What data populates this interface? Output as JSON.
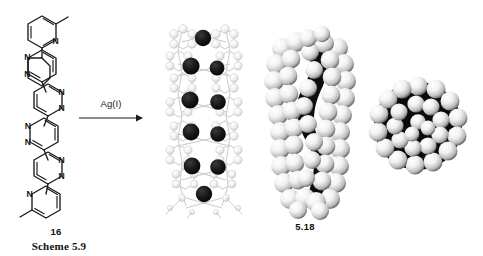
{
  "scheme": {
    "caption": "Scheme 5.9",
    "reagent": "Ag(I)",
    "reactant_label": "16",
    "product_label": "5.18"
  },
  "reactant": {
    "name": "16",
    "description": "Oligopyridazine strand: bis(6-methylpyridin-2-yl) end-capped quaterpyridazine",
    "atom_labels": [
      "N",
      "N",
      "N",
      "N",
      "N",
      "N",
      "N",
      "N",
      "N",
      "N"
    ],
    "rings": [
      {
        "index": 0,
        "type": "pyridine",
        "nitrogen_side": "right",
        "substituent": "methyl"
      },
      {
        "index": 1,
        "type": "pyridazine",
        "nitrogen_side": "left"
      },
      {
        "index": 2,
        "type": "pyridazine",
        "nitrogen_side": "right"
      },
      {
        "index": 3,
        "type": "pyridazine",
        "nitrogen_side": "left"
      },
      {
        "index": 4,
        "type": "pyridazine",
        "nitrogen_side": "right"
      },
      {
        "index": 5,
        "type": "pyridine",
        "nitrogen_side": "left",
        "substituent": "methyl"
      }
    ]
  },
  "product": {
    "name": "5.18",
    "description": "Silver(I) double helicate",
    "views": [
      {
        "view": "ball-and-stick",
        "orientation": "side",
        "metal_centers": 10,
        "metal_color": "#141414",
        "ligand_color": "#f2f2f2"
      },
      {
        "view": "space-filling",
        "orientation": "side",
        "sphere_color": "#ededed",
        "shadow_color": "#111111"
      },
      {
        "view": "space-filling",
        "orientation": "axial",
        "sphere_color": "#ededed",
        "shadow_color": "#111111"
      }
    ]
  },
  "colors": {
    "ink": "#1a1a1a",
    "background": "#ffffff",
    "metal": "#141414",
    "sphere": "#ededed"
  },
  "icons": {
    "arrow": "reaction-arrow-right"
  }
}
